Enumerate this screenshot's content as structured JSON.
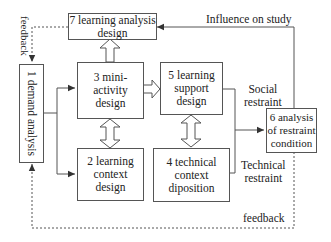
{
  "diagram": {
    "type": "flowchart",
    "nodes": [
      {
        "id": "1",
        "label": "1 demand analysis"
      },
      {
        "id": "2",
        "label_line1": "2 learning",
        "label_line2": "context design"
      },
      {
        "id": "3",
        "label_line1": "3 mini-activity",
        "label_line2": "design"
      },
      {
        "id": "4",
        "label_line1": "4 technical",
        "label_line2": "context diposition"
      },
      {
        "id": "5",
        "label_line1": "5 learning",
        "label_line2": "support design"
      },
      {
        "id": "6",
        "label_line1": "6 analysis",
        "label_line2": "of restraint",
        "label_line3": "condition"
      },
      {
        "id": "7",
        "label_line1": "7 learning analysis",
        "label_line2": "design"
      }
    ],
    "edge_labels": {
      "influence": "Influence on study",
      "social_1": "Social",
      "social_2": "restraint",
      "technical_1": "Technical",
      "technical_2": "restraint",
      "feedback_top": "feedback",
      "feedback_bottom": "feedback"
    },
    "edges": [
      {
        "from": "1",
        "to": "3",
        "style": "solid-arrow"
      },
      {
        "from": "1",
        "to": "2",
        "style": "solid-arrow"
      },
      {
        "from": "3",
        "to": "7",
        "style": "hollow-arrow"
      },
      {
        "from": "3",
        "to": "5",
        "style": "hollow-arrow"
      },
      {
        "from": "3",
        "to": "2",
        "style": "hollow-double-arrow"
      },
      {
        "from": "5",
        "to": "4",
        "style": "hollow-double-arrow"
      },
      {
        "from": "5",
        "to": "6",
        "style": "solid-arrow",
        "label": "Social restraint"
      },
      {
        "from": "4",
        "to": "6",
        "style": "solid-arrow",
        "label": "Technical restraint"
      },
      {
        "from": "6",
        "to": "7",
        "style": "solid-arrow",
        "label": "Influence on study"
      },
      {
        "from": "7",
        "to": "1",
        "style": "dashed-arrow",
        "label": "feedback"
      },
      {
        "from": "6",
        "to": "1",
        "style": "dashed-arrow",
        "label": "feedback"
      }
    ]
  }
}
